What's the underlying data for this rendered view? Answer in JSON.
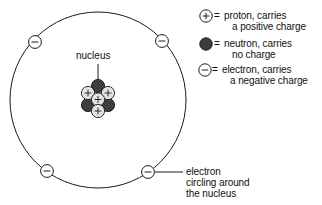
{
  "diagram": {
    "title_label": "nucleus",
    "orbit": {
      "center_x": 98,
      "center_y": 100,
      "radius": 88,
      "stroke": "#1a1a1a"
    },
    "colors": {
      "line": "#1a1a1a",
      "text": "#111111",
      "proton_fill": "#ffffff",
      "neutron_fill": "#4a4a4a",
      "electron_fill": "#ffffff",
      "background": "#ffffff"
    },
    "electrons_on_orbit": [
      {
        "name": "electron-top-left",
        "x": 35,
        "y": 42,
        "symbol": "−"
      },
      {
        "name": "electron-top-right",
        "x": 162,
        "y": 41,
        "symbol": "−"
      },
      {
        "name": "electron-bottom-left",
        "x": 47,
        "y": 171,
        "symbol": "−"
      },
      {
        "name": "electron-bottom-right",
        "x": 148,
        "y": 172,
        "symbol": "−"
      }
    ],
    "nucleus": {
      "proton_count": 4,
      "neutron_count": 3,
      "proton_symbol": "+",
      "particles": [
        {
          "name": "neutron-top",
          "type": "neutron",
          "x": 98,
          "y": 85
        },
        {
          "name": "proton-upper-left",
          "type": "proton",
          "x": 88,
          "y": 92
        },
        {
          "name": "proton-upper-right",
          "type": "proton",
          "x": 108,
          "y": 92
        },
        {
          "name": "proton-center",
          "type": "proton",
          "x": 98,
          "y": 99
        },
        {
          "name": "neutron-lower-left",
          "type": "neutron",
          "x": 88,
          "y": 105
        },
        {
          "name": "neutron-lower-right",
          "type": "neutron",
          "x": 108,
          "y": 105
        },
        {
          "name": "proton-bottom",
          "type": "proton",
          "x": 98,
          "y": 110
        }
      ]
    },
    "nucleus_leader": {
      "x": 98,
      "y1": 64,
      "y2": 80
    },
    "callout": {
      "lines": [
        "electron",
        "circling around",
        "the nucleus"
      ],
      "leader": {
        "x1": 156,
        "y1": 172,
        "x2": 182,
        "y2": 172
      }
    }
  },
  "legend": {
    "equals": "=",
    "items": [
      {
        "key": "proton",
        "symbol_name": "proton-symbol",
        "symbol": "+",
        "lines": [
          "proton, carries",
          "a positive charge"
        ]
      },
      {
        "key": "neutron",
        "symbol_name": "neutron-symbol",
        "symbol": "",
        "lines": [
          "neutron, carries",
          "no charge"
        ]
      },
      {
        "key": "electron",
        "symbol_name": "electron-symbol",
        "symbol": "−",
        "lines": [
          "electron, carries",
          "a negative charge"
        ]
      }
    ]
  }
}
